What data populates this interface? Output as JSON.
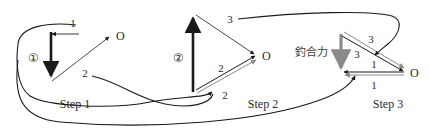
{
  "figure": {
    "background": "#ffffff",
    "ink_dark": "#1a1a1a",
    "ink_mid": "#4a4a4a",
    "ink_grey": "#8a8a8a"
  },
  "steps": [
    {
      "id": "step1",
      "caption": "Step 1",
      "badge": "①",
      "origin_label": "O",
      "vector_labels": [
        "1",
        "2"
      ]
    },
    {
      "id": "step2",
      "caption": "Step 2",
      "badge": "②",
      "origin_label": "O",
      "vector_labels": [
        "3",
        "2",
        "2"
      ]
    },
    {
      "id": "step3",
      "caption": "Step 3",
      "badge": "",
      "origin_label": "O",
      "vector_labels": [
        "3",
        "3",
        "1",
        "1"
      ],
      "annotation": "釣合力"
    }
  ]
}
